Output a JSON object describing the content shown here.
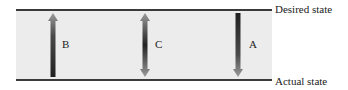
{
  "diagram": {
    "levels": {
      "top_label": "Desired state",
      "bottom_label": "Actual state"
    },
    "arrows": [
      {
        "id": "B",
        "label": "B",
        "direction": "up"
      },
      {
        "id": "C",
        "label": "C",
        "direction": "both"
      },
      {
        "id": "A",
        "label": "A",
        "direction": "down"
      }
    ],
    "colors": {
      "band": "#ececec",
      "line": "#3a3a3a",
      "arrow_dark": "#2a2a2a",
      "arrow_light": "#9a9a9a"
    }
  }
}
